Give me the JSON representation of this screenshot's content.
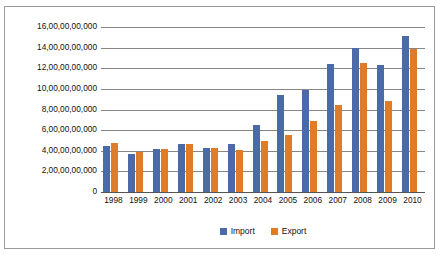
{
  "chart_data": {
    "type": "bar",
    "title": "",
    "xlabel": "",
    "ylabel": "",
    "grid": true,
    "legend_position": "bottom",
    "ylim": [
      0,
      16000000000
    ],
    "y_tick_values": [
      0,
      2000000000,
      4000000000,
      6000000000,
      8000000000,
      10000000000,
      12000000000,
      14000000000,
      16000000000
    ],
    "y_tick_labels": [
      "0",
      "2,00,00,00,000",
      "4,00,00,00,000",
      "6,00,00,00,000",
      "8,00,00,00,000",
      "10,00,00,00,000",
      "12,00,00,00,000",
      "14,00,00,00,000",
      "16,00,00,00,000"
    ],
    "categories": [
      "1998",
      "1999",
      "2000",
      "2001",
      "2002",
      "2003",
      "2004",
      "2005",
      "2006",
      "2007",
      "2008",
      "2009",
      "2010"
    ],
    "series": [
      {
        "name": "Import",
        "color": "#4a6aa8",
        "values": [
          4500000000,
          3700000000,
          4200000000,
          4700000000,
          4300000000,
          4700000000,
          6500000000,
          9400000000,
          9900000000,
          12400000000,
          14000000000,
          12300000000,
          15100000000
        ]
      },
      {
        "name": "Export",
        "color": "#e07b28",
        "values": [
          4800000000,
          3900000000,
          4200000000,
          4700000000,
          4300000000,
          4100000000,
          4900000000,
          5500000000,
          6900000000,
          8400000000,
          12500000000,
          8800000000,
          13900000000
        ]
      }
    ]
  },
  "legend": {
    "items": [
      {
        "label": "Import",
        "color": "#4a6aa8"
      },
      {
        "label": "Export",
        "color": "#e07b28"
      }
    ]
  },
  "colors": {
    "import": "#4a6aa8",
    "export": "#e07b28",
    "gridline": "#868686",
    "border": "#9a9a9a",
    "background": "#ffffff"
  }
}
